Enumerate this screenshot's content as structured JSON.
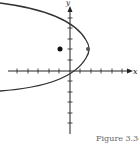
{
  "diagram": {
    "type": "parabola-graph",
    "x_axis_label": "x",
    "y_axis_label": "y",
    "parabola": {
      "opens": "left",
      "vertex": [
        2,
        2
      ],
      "passes_through": [
        0,
        0
      ]
    },
    "focus_point": [
      -1,
      2
    ],
    "colors": {
      "curve": "#333333",
      "axes": "#222222",
      "point": "#111111"
    }
  },
  "caption": "Figure 3.36"
}
